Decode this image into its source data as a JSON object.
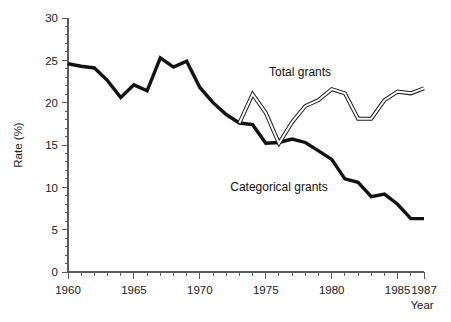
{
  "chart_data": {
    "type": "line",
    "title": "",
    "xlabel": "Year",
    "ylabel": "Rate (%)",
    "xlim": [
      1960,
      1987
    ],
    "ylim": [
      0,
      30
    ],
    "grid": false,
    "legend_position": "inline-annotations",
    "x_ticks_major": [
      1960,
      1965,
      1970,
      1975,
      1980,
      1985,
      1987
    ],
    "x_tick_labels": [
      "1960",
      "1965",
      "1970",
      "1975",
      "1980",
      "1985",
      "1987"
    ],
    "x_ticks_minor": [
      1961,
      1962,
      1963,
      1964,
      1966,
      1967,
      1968,
      1969,
      1971,
      1972,
      1973,
      1974,
      1976,
      1977,
      1978,
      1979,
      1981,
      1982,
      1983,
      1984,
      1986
    ],
    "y_ticks_major": [
      0,
      5,
      10,
      15,
      20,
      25,
      30
    ],
    "y_tick_labels": [
      "0",
      "5",
      "10",
      "15",
      "20",
      "25",
      "30"
    ],
    "y_ticks_minor": [
      1,
      2,
      3,
      4,
      6,
      7,
      8,
      9,
      11,
      12,
      13,
      14,
      16,
      17,
      18,
      19,
      21,
      22,
      23,
      24,
      26,
      27,
      28,
      29
    ],
    "series": [
      {
        "name": "Categorical grants",
        "style": "solid-thick-black",
        "color": "#111111",
        "label_x": 1976.0,
        "label_y": 9.6,
        "x": [
          1960,
          1961,
          1962,
          1963,
          1964,
          1965,
          1966,
          1967,
          1968,
          1969,
          1970,
          1971,
          1972,
          1973,
          1974,
          1975,
          1976,
          1977,
          1978,
          1979,
          1980,
          1981,
          1982,
          1983,
          1984,
          1985,
          1986,
          1987
        ],
        "values": [
          24.6,
          24.3,
          24.1,
          22.6,
          20.6,
          22.1,
          21.4,
          25.3,
          24.2,
          24.9,
          21.8,
          20.0,
          18.6,
          17.6,
          17.4,
          15.2,
          15.3,
          15.7,
          15.3,
          14.3,
          13.3,
          11.0,
          10.6,
          8.9,
          9.2,
          8.0,
          6.3,
          6.3
        ]
      },
      {
        "name": "Total grants",
        "style": "double-outline-white",
        "color": "#1a1a1a",
        "label_x": 1977.6,
        "label_y": 23.1,
        "x": [
          1973,
          1974,
          1975,
          1976,
          1977,
          1978,
          1979,
          1980,
          1981,
          1982,
          1983,
          1984,
          1985,
          1986,
          1987
        ],
        "values": [
          17.6,
          21.0,
          18.8,
          15.2,
          17.7,
          19.6,
          20.3,
          21.6,
          21.1,
          18.1,
          18.1,
          20.3,
          21.3,
          21.1,
          21.7
        ]
      }
    ],
    "annotations": [
      {
        "text": "Total grants",
        "x": 1977.6,
        "y": 23.1
      },
      {
        "text": "Categorical grants",
        "x": 1976.0,
        "y": 9.6
      }
    ]
  },
  "axes": {
    "y_axis_title": "Rate (%)",
    "x_axis_title": "Year"
  }
}
